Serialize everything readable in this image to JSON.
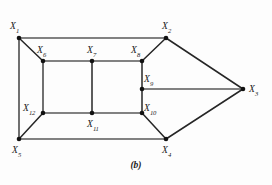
{
  "figure": {
    "caption": "(b)",
    "background_color": "#fdfdfd",
    "node_color": "#111111",
    "edge_color_dark": "#262626",
    "edge_color_gray": "#585858",
    "label_color": "#1a1a1a"
  },
  "graph": {
    "nodes": [
      {
        "id": "x1",
        "base": "X",
        "sub": "1",
        "x": 19,
        "y": 38,
        "label_dx": -9,
        "label_dy": -16
      },
      {
        "id": "x2",
        "base": "X",
        "sub": "2",
        "x": 166,
        "y": 38,
        "label_dx": -4,
        "label_dy": -16
      },
      {
        "id": "x3",
        "base": "X",
        "sub": "3",
        "x": 243,
        "y": 89,
        "label_dx": 6,
        "label_dy": -4
      },
      {
        "id": "x4",
        "base": "X",
        "sub": "4",
        "x": 166,
        "y": 139,
        "label_dx": -4,
        "label_dy": 7
      },
      {
        "id": "x5",
        "base": "X",
        "sub": "5",
        "x": 19,
        "y": 139,
        "label_dx": -7,
        "label_dy": 7
      },
      {
        "id": "x6",
        "base": "X",
        "sub": "6",
        "x": 43,
        "y": 61,
        "label_dx": -6,
        "label_dy": -15
      },
      {
        "id": "x7",
        "base": "X",
        "sub": "7",
        "x": 92,
        "y": 61,
        "label_dx": -5,
        "label_dy": -15
      },
      {
        "id": "x8",
        "base": "X",
        "sub": "8",
        "x": 142,
        "y": 61,
        "label_dx": -11,
        "label_dy": -15
      },
      {
        "id": "x9",
        "base": "X",
        "sub": "9",
        "x": 142,
        "y": 89,
        "label_dx": 2,
        "label_dy": -14
      },
      {
        "id": "x10",
        "base": "X",
        "sub": "10",
        "x": 142,
        "y": 113,
        "label_dx": 2,
        "label_dy": -9
      },
      {
        "id": "x11",
        "base": "X",
        "sub": "11",
        "x": 92,
        "y": 113,
        "label_dx": -5,
        "label_dy": 7
      },
      {
        "id": "x12",
        "base": "X",
        "sub": "12",
        "x": 43,
        "y": 113,
        "label_dx": -20,
        "label_dy": -9
      }
    ],
    "edges": [
      {
        "from": "x1",
        "to": "x2",
        "tone": "gray"
      },
      {
        "from": "x1",
        "to": "x5",
        "tone": "gray"
      },
      {
        "from": "x1",
        "to": "x6",
        "tone": "dark"
      },
      {
        "from": "x2",
        "to": "x8",
        "tone": "dark"
      },
      {
        "from": "x2",
        "to": "x3",
        "tone": "dark"
      },
      {
        "from": "x3",
        "to": "x9",
        "tone": "gray"
      },
      {
        "from": "x3",
        "to": "x4",
        "tone": "dark"
      },
      {
        "from": "x4",
        "to": "x5",
        "tone": "gray"
      },
      {
        "from": "x4",
        "to": "x10",
        "tone": "dark"
      },
      {
        "from": "x5",
        "to": "x12",
        "tone": "dark"
      },
      {
        "from": "x6",
        "to": "x7",
        "tone": "gray"
      },
      {
        "from": "x6",
        "to": "x12",
        "tone": "gray"
      },
      {
        "from": "x7",
        "to": "x8",
        "tone": "gray"
      },
      {
        "from": "x7",
        "to": "x11",
        "tone": "dark"
      },
      {
        "from": "x8",
        "to": "x9",
        "tone": "dark"
      },
      {
        "from": "x9",
        "to": "x10",
        "tone": "dark"
      },
      {
        "from": "x10",
        "to": "x11",
        "tone": "gray"
      },
      {
        "from": "x11",
        "to": "x12",
        "tone": "gray"
      }
    ]
  }
}
